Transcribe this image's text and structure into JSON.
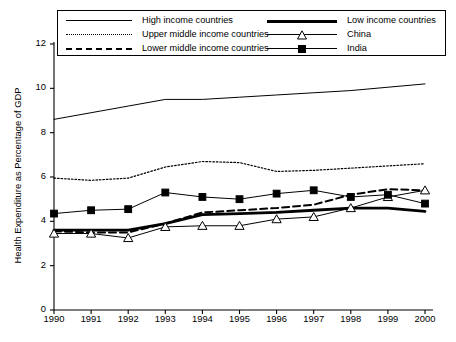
{
  "chart_data": {
    "type": "line",
    "title": "",
    "xlabel": "",
    "ylabel": "Health Expenditure as Percentage of GDP",
    "x": [
      1990,
      1991,
      1992,
      1993,
      1994,
      1995,
      1996,
      1997,
      1998,
      1999,
      2000
    ],
    "xlim": [
      1990,
      2000
    ],
    "ylim": [
      0,
      12
    ],
    "yticks": [
      0,
      2,
      4,
      6,
      8,
      10,
      12
    ],
    "xticks": [
      "1990",
      "1991",
      "1992",
      "1993",
      "1994",
      "1995",
      "1996",
      "1997",
      "1998",
      "1999",
      "2000"
    ],
    "grid": false,
    "legend_position": "top",
    "series": [
      {
        "name": "High income countries",
        "style": "solid-thin",
        "marker": "none",
        "values": [
          8.6,
          8.9,
          9.2,
          9.5,
          9.5,
          9.6,
          9.7,
          9.8,
          9.9,
          10.05,
          10.2
        ]
      },
      {
        "name": "Upper middle income countries",
        "style": "dotted",
        "marker": "none",
        "values": [
          5.95,
          5.85,
          5.95,
          6.45,
          6.7,
          6.65,
          6.25,
          6.3,
          6.4,
          6.5,
          6.6
        ]
      },
      {
        "name": "Lower middle income countries",
        "style": "dashed",
        "marker": "none",
        "values": [
          3.55,
          3.5,
          3.5,
          3.9,
          4.4,
          4.5,
          4.6,
          4.75,
          5.2,
          5.45,
          5.4
        ]
      },
      {
        "name": "Low income countries",
        "style": "solid-thick",
        "marker": "none",
        "values": [
          3.6,
          3.6,
          3.6,
          3.9,
          4.3,
          4.35,
          4.4,
          4.5,
          4.6,
          4.6,
          4.45
        ]
      },
      {
        "name": "China",
        "style": "solid-thin",
        "marker": "triangle",
        "values": [
          3.45,
          3.45,
          3.25,
          3.75,
          3.8,
          3.8,
          4.1,
          4.2,
          4.6,
          5.1,
          5.4
        ]
      },
      {
        "name": "India",
        "style": "solid-thin",
        "marker": "square",
        "values": [
          4.35,
          4.5,
          4.55,
          5.3,
          5.1,
          5.0,
          5.25,
          5.4,
          5.1,
          5.2,
          4.8
        ]
      }
    ]
  },
  "legend": {
    "entries": [
      {
        "label": "High income countries",
        "style": "solid-thin",
        "marker": "none"
      },
      {
        "label": "Low income countries",
        "style": "solid-thick",
        "marker": "none"
      },
      {
        "label": "Upper middle income countries",
        "style": "dotted",
        "marker": "none"
      },
      {
        "label": "China",
        "style": "solid-thin",
        "marker": "triangle"
      },
      {
        "label": "Lower middle income countries",
        "style": "dashed",
        "marker": "none"
      },
      {
        "label": "India",
        "style": "solid-thin",
        "marker": "square"
      }
    ]
  },
  "colors": {
    "line": "#000000",
    "axis": "#000000",
    "background": "#ffffff"
  }
}
